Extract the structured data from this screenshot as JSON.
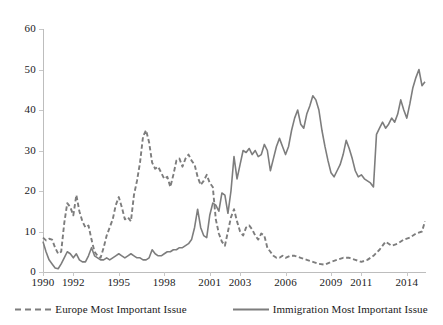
{
  "chart_data": {
    "type": "line",
    "title": "",
    "subtitle": "",
    "xlabel": "",
    "ylabel": "",
    "xlim": [
      1990,
      2015.2
    ],
    "ylim": [
      0,
      60
    ],
    "grid": false,
    "legend_position": "bottom",
    "y_ticks": [
      0,
      10,
      20,
      30,
      40,
      50,
      60
    ],
    "x_ticks": [
      1990,
      1992,
      1995,
      1998,
      2001,
      2003,
      2006,
      2009,
      2011,
      2014
    ],
    "x_tick_labels": [
      "1990",
      "1992",
      "1995",
      "1998",
      "2001",
      "2003",
      "2006",
      "2009",
      "2011",
      "2014"
    ],
    "y_tick_labels": [
      "0",
      "10",
      "20",
      "30",
      "40",
      "50",
      "60"
    ],
    "series": [
      {
        "name": "Europe Most Important Issue",
        "style": "dashed",
        "color": "#7d7d7d",
        "x": [
          1990.0,
          1990.2,
          1990.4,
          1990.6,
          1990.8,
          1991.0,
          1991.2,
          1991.4,
          1991.6,
          1991.8,
          1992.0,
          1992.2,
          1992.4,
          1992.6,
          1992.8,
          1993.0,
          1993.2,
          1993.4,
          1993.6,
          1993.8,
          1994.0,
          1994.2,
          1994.4,
          1994.6,
          1994.8,
          1995.0,
          1995.2,
          1995.4,
          1995.6,
          1995.8,
          1996.0,
          1996.2,
          1996.4,
          1996.6,
          1996.8,
          1997.0,
          1997.2,
          1997.4,
          1997.6,
          1997.8,
          1998.0,
          1998.2,
          1998.4,
          1998.6,
          1998.8,
          1999.0,
          1999.2,
          1999.4,
          1999.6,
          1999.8,
          2000.0,
          2000.2,
          2000.4,
          2000.6,
          2000.8,
          2001.0,
          2001.2,
          2001.4,
          2001.6,
          2001.8,
          2002.0,
          2002.2,
          2002.4,
          2002.6,
          2002.8,
          2003.0,
          2003.2,
          2003.4,
          2003.6,
          2003.8,
          2004.0,
          2004.2,
          2004.4,
          2004.6,
          2004.8,
          2005.0,
          2005.2,
          2005.4,
          2005.6,
          2005.8,
          2006.0,
          2006.3,
          2006.6,
          2007.0,
          2007.4,
          2007.8,
          2008.2,
          2008.6,
          2009.0,
          2009.4,
          2009.8,
          2010.2,
          2010.6,
          2011.0,
          2011.4,
          2011.8,
          2012.2,
          2012.6,
          2013.0,
          2013.4,
          2013.8,
          2014.2,
          2014.6,
          2015.0,
          2015.2
        ],
        "y": [
          8.5,
          7.8,
          8.2,
          8.0,
          6.0,
          4.5,
          5.0,
          12.0,
          17.0,
          16.0,
          14.0,
          19.0,
          15.0,
          12.5,
          11.0,
          11.5,
          8.0,
          5.0,
          4.0,
          3.5,
          6.0,
          9.0,
          11.0,
          13.0,
          16.5,
          18.5,
          16.0,
          13.0,
          13.5,
          12.5,
          19.0,
          22.5,
          27.0,
          33.5,
          35.0,
          32.0,
          27.0,
          25.5,
          26.0,
          24.5,
          23.0,
          23.5,
          21.0,
          24.0,
          27.5,
          28.0,
          26.0,
          28.0,
          29.0,
          27.5,
          26.5,
          23.5,
          21.5,
          22.5,
          24.0,
          22.0,
          21.0,
          13.0,
          9.5,
          7.5,
          6.5,
          10.0,
          13.5,
          15.5,
          12.5,
          10.0,
          9.0,
          11.0,
          11.5,
          10.5,
          9.0,
          8.0,
          9.5,
          9.0,
          6.0,
          5.0,
          4.0,
          3.5,
          3.5,
          4.0,
          3.5,
          4.0,
          4.0,
          3.5,
          3.0,
          2.5,
          2.0,
          1.8,
          2.5,
          3.0,
          3.5,
          3.5,
          3.0,
          2.5,
          3.0,
          4.0,
          5.5,
          7.5,
          6.5,
          7.0,
          8.0,
          8.5,
          9.5,
          10.0,
          12.5
        ]
      },
      {
        "name": "Immigration Most Important Issue",
        "style": "solid",
        "color": "#7d7d7d",
        "x": [
          1990.0,
          1990.2,
          1990.4,
          1990.6,
          1990.8,
          1991.0,
          1991.2,
          1991.4,
          1991.6,
          1991.8,
          1992.0,
          1992.2,
          1992.4,
          1992.6,
          1992.8,
          1993.0,
          1993.2,
          1993.4,
          1993.6,
          1993.8,
          1994.0,
          1994.2,
          1994.4,
          1994.6,
          1994.8,
          1995.0,
          1995.2,
          1995.4,
          1995.6,
          1995.8,
          1996.0,
          1996.2,
          1996.4,
          1996.6,
          1996.8,
          1997.0,
          1997.2,
          1997.4,
          1997.6,
          1997.8,
          1998.0,
          1998.2,
          1998.4,
          1998.6,
          1998.8,
          1999.0,
          1999.2,
          1999.4,
          1999.6,
          1999.8,
          2000.0,
          2000.2,
          2000.4,
          2000.6,
          2000.8,
          2001.0,
          2001.2,
          2001.4,
          2001.6,
          2001.8,
          2002.0,
          2002.2,
          2002.4,
          2002.6,
          2002.8,
          2003.0,
          2003.2,
          2003.4,
          2003.6,
          2003.8,
          2004.0,
          2004.2,
          2004.4,
          2004.6,
          2004.8,
          2005.0,
          2005.2,
          2005.4,
          2005.6,
          2005.8,
          2006.0,
          2006.2,
          2006.4,
          2006.6,
          2006.8,
          2007.0,
          2007.2,
          2007.4,
          2007.6,
          2007.8,
          2008.0,
          2008.2,
          2008.4,
          2008.6,
          2008.8,
          2009.0,
          2009.2,
          2009.4,
          2009.6,
          2009.8,
          2010.0,
          2010.2,
          2010.4,
          2010.6,
          2010.8,
          2011.0,
          2011.2,
          2011.4,
          2011.6,
          2011.8,
          2012.0,
          2012.2,
          2012.4,
          2012.6,
          2012.8,
          2013.0,
          2013.2,
          2013.4,
          2013.6,
          2013.8,
          2014.0,
          2014.2,
          2014.4,
          2014.6,
          2014.8,
          2015.0,
          2015.2
        ],
        "y": [
          7.5,
          5.0,
          3.0,
          2.0,
          1.0,
          0.8,
          2.0,
          3.5,
          5.0,
          4.5,
          3.5,
          4.5,
          3.0,
          2.5,
          2.5,
          4.0,
          6.0,
          4.0,
          3.5,
          3.0,
          3.0,
          3.5,
          3.0,
          3.5,
          4.0,
          4.5,
          4.0,
          3.5,
          4.0,
          4.5,
          4.0,
          3.5,
          3.5,
          3.0,
          3.0,
          3.5,
          5.5,
          4.5,
          4.0,
          4.0,
          4.5,
          5.0,
          5.0,
          5.5,
          5.5,
          6.0,
          6.0,
          6.5,
          7.0,
          8.0,
          11.0,
          15.5,
          11.0,
          9.0,
          8.5,
          14.0,
          17.0,
          16.5,
          15.0,
          19.5,
          19.0,
          14.5,
          20.0,
          28.5,
          23.0,
          26.5,
          30.0,
          29.5,
          30.5,
          29.0,
          30.0,
          28.5,
          29.0,
          31.5,
          30.0,
          25.0,
          28.0,
          31.0,
          33.0,
          31.0,
          29.0,
          31.0,
          35.0,
          38.0,
          40.0,
          36.5,
          35.5,
          39.0,
          41.0,
          43.5,
          42.5,
          40.0,
          35.0,
          31.0,
          27.5,
          24.5,
          23.5,
          25.0,
          26.5,
          29.0,
          32.5,
          30.5,
          28.0,
          25.0,
          23.5,
          24.0,
          23.0,
          22.5,
          22.0,
          21.0,
          34.0,
          35.5,
          37.0,
          35.5,
          36.5,
          38.0,
          37.0,
          39.0,
          42.5,
          40.0,
          38.0,
          41.5,
          45.5,
          48.0,
          50.0,
          46.0,
          47.0
        ]
      }
    ]
  },
  "legend": {
    "items": [
      {
        "label": "Europe Most Important Issue",
        "style": "dashed",
        "color": "#7d7d7d"
      },
      {
        "label": "Immigration Most Important Issue",
        "style": "solid",
        "color": "#7d7d7d"
      }
    ]
  },
  "axes": {
    "axis_color": "#bdbdbd",
    "tick_color": "#c8c8c8",
    "label_color": "#1a1a1a"
  }
}
